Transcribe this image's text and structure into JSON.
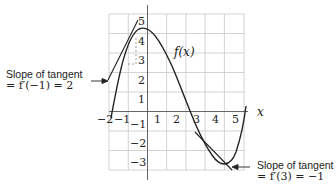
{
  "diagram": {
    "function_label": "f(x)",
    "x_axis_label": "x",
    "x_ticks": [
      "−2",
      "−1",
      "1",
      "2",
      "3",
      "4",
      "5"
    ],
    "y_ticks": [
      "5",
      "4",
      "3",
      "2",
      "1",
      "−1",
      "−2",
      "−3"
    ],
    "annotations": [
      {
        "line1": "Slope of tangent",
        "line2": "= f′(−1) = 2"
      },
      {
        "line1": "Slope of tangent",
        "line2": "= f′(3) = −1"
      }
    ],
    "colors": {
      "grid": "#c8c8c8",
      "curve": "#222222",
      "axis": "#555555"
    }
  }
}
